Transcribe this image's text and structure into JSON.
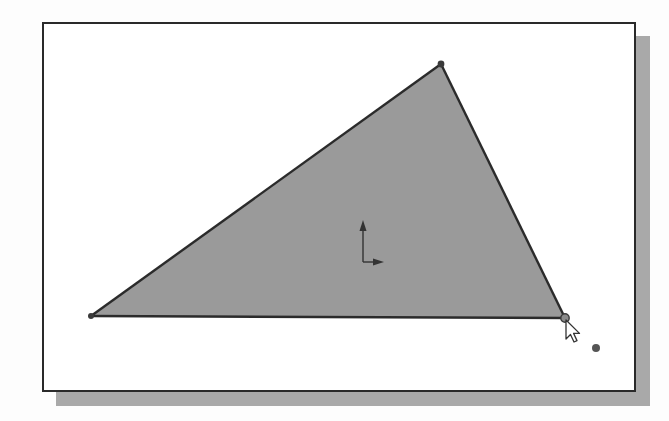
{
  "app": {
    "view": "sketch-graphics-area"
  },
  "colors": {
    "background": "#ffffff",
    "frame_border": "#2a2a2a",
    "frame_shadow": "#a9a9a9",
    "sketch_fill": "#9a9a9a",
    "sketch_edge": "#2b2b2b",
    "vertex_point": "#3a3a3a",
    "origin_axis": "#333333",
    "cursor_fill": "#ffffff",
    "cursor_outline": "#333333",
    "inference_dot": "#555555"
  },
  "sketch": {
    "shape": "triangle",
    "filled": true,
    "vertices": [
      {
        "name": "left",
        "x": 91,
        "y": 316
      },
      {
        "name": "top",
        "x": 441,
        "y": 64
      },
      {
        "name": "right",
        "x": 565,
        "y": 318
      }
    ],
    "selected_vertex": "right"
  },
  "origin": {
    "icon": "sketch-origin-axis-icon",
    "x": 363,
    "y": 262
  },
  "cursor": {
    "icon": "arrow-pointer-icon",
    "x": 566,
    "y": 320
  },
  "inference_point": {
    "x": 596,
    "y": 348
  }
}
